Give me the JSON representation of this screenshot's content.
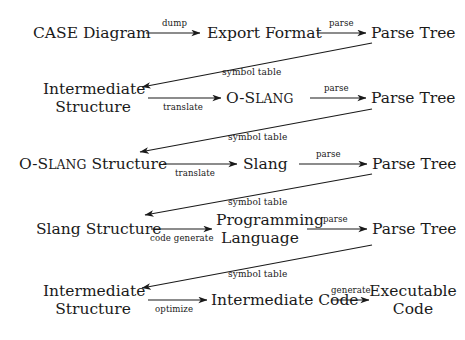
{
  "diagram": {
    "type": "flow-pipeline",
    "background_color": "#ffffff",
    "line_color": "#1a1a1a",
    "rows": [
      {
        "id": "row-1",
        "source": "CASE Diagram",
        "middle": "Export Format",
        "target": "Parse Tree",
        "edge_1_label": "dump",
        "edge_2_label": "parse"
      },
      {
        "id": "row-2",
        "source_line_1": "Intermediate",
        "source_line_2": "Structure",
        "middle_prefix": "O-S",
        "middle_smallcaps": "LANG",
        "target": "Parse Tree",
        "edge_1_label": "translate",
        "edge_2_label": "parse",
        "feedback_label": "symbol table"
      },
      {
        "id": "row-3",
        "source_prefix": "O-S",
        "source_smallcaps": "LANG",
        "source_suffix": " Structure",
        "middle": "Slang",
        "target": "Parse Tree",
        "edge_1_label": "translate",
        "edge_2_label": "parse",
        "feedback_label": "symbol table"
      },
      {
        "id": "row-4",
        "source": "Slang Structure",
        "middle_line_1": "Programming",
        "middle_line_2": "Language",
        "target": "Parse Tree",
        "edge_1_label": "code generate",
        "edge_2_label": "parse",
        "feedback_label": "symbol table"
      },
      {
        "id": "row-5",
        "source_line_1": "Intermediate",
        "source_line_2": "Structure",
        "middle": "Intermediate Code",
        "target_line_1": "Executable",
        "target_line_2": "Code",
        "edge_1_label": "optimize",
        "edge_2_label": "generate",
        "feedback_label": "symbol table"
      }
    ]
  }
}
